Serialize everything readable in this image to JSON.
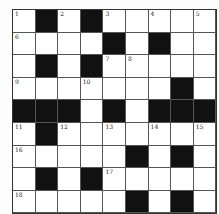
{
  "puzzle": {
    "rows": 9,
    "cols": 9,
    "layout": [
      "W.W.WWWWW",
      "WWWW.W.WW",
      "W.W.WWWWW",
      "WWWWWWW.W",
      "...W.W...",
      "W.WWWWWWW",
      "WWWWW.W.W",
      "W.W.WWWWW",
      "WWWWW.W.W"
    ],
    "numbers": [
      {
        "r": 0,
        "c": 0,
        "n": "1"
      },
      {
        "r": 0,
        "c": 2,
        "n": "2"
      },
      {
        "r": 0,
        "c": 4,
        "n": "3"
      },
      {
        "r": 0,
        "c": 6,
        "n": "4"
      },
      {
        "r": 0,
        "c": 8,
        "n": "5"
      },
      {
        "r": 1,
        "c": 0,
        "n": "6"
      },
      {
        "r": 2,
        "c": 4,
        "n": "7"
      },
      {
        "r": 2,
        "c": 5,
        "n": "8"
      },
      {
        "r": 3,
        "c": 0,
        "n": "9"
      },
      {
        "r": 3,
        "c": 3,
        "n": "10"
      },
      {
        "r": 5,
        "c": 0,
        "n": "11"
      },
      {
        "r": 5,
        "c": 2,
        "n": "12"
      },
      {
        "r": 5,
        "c": 4,
        "n": "13"
      },
      {
        "r": 5,
        "c": 6,
        "n": "14"
      },
      {
        "r": 5,
        "c": 8,
        "n": "15"
      },
      {
        "r": 6,
        "c": 0,
        "n": "16"
      },
      {
        "r": 7,
        "c": 4,
        "n": "17"
      },
      {
        "r": 8,
        "c": 0,
        "n": "18"
      }
    ]
  }
}
